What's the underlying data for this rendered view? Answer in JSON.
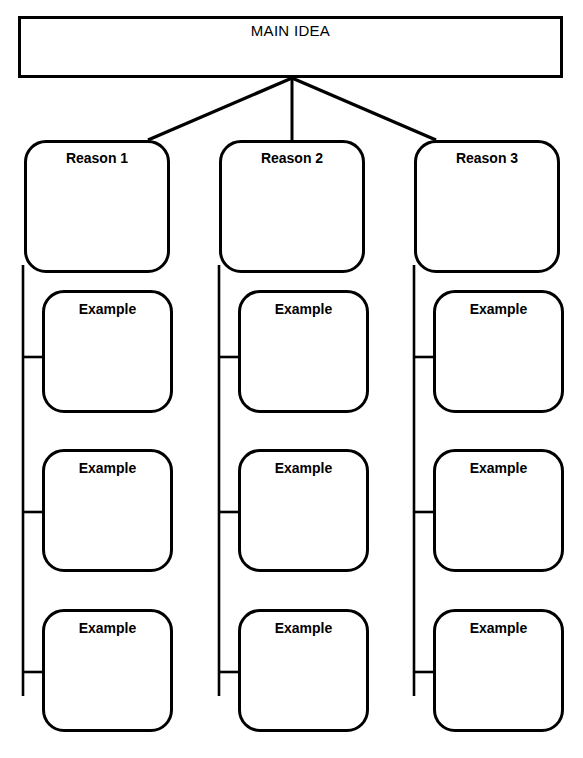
{
  "page": {
    "width": 583,
    "height": 758,
    "background_color": "#ffffff",
    "line_color": "#000000",
    "caption_cut_off": "FIGURE 5"
  },
  "diagram": {
    "type": "hierarchical-graphic-organizer",
    "title_node": {
      "label": "MAIN IDEA",
      "shape": "rectangle",
      "bold": false
    },
    "branches": [
      {
        "reason": {
          "label": "Reason 1",
          "shape": "rounded-rectangle",
          "bold": true
        },
        "examples": [
          {
            "label": "Example",
            "shape": "rounded-rectangle",
            "bold": true
          },
          {
            "label": "Example",
            "shape": "rounded-rectangle",
            "bold": true
          },
          {
            "label": "Example",
            "shape": "rounded-rectangle",
            "bold": true
          }
        ]
      },
      {
        "reason": {
          "label": "Reason 2",
          "shape": "rounded-rectangle",
          "bold": true
        },
        "examples": [
          {
            "label": "Example",
            "shape": "rounded-rectangle",
            "bold": true
          },
          {
            "label": "Example",
            "shape": "rounded-rectangle",
            "bold": true
          },
          {
            "label": "Example",
            "shape": "rounded-rectangle",
            "bold": true
          }
        ]
      },
      {
        "reason": {
          "label": "Reason 3",
          "shape": "rounded-rectangle",
          "bold": true
        },
        "examples": [
          {
            "label": "Example",
            "shape": "rounded-rectangle",
            "bold": true
          },
          {
            "label": "Example",
            "shape": "rounded-rectangle",
            "bold": true
          },
          {
            "label": "Example",
            "shape": "rounded-rectangle",
            "bold": true
          }
        ]
      }
    ]
  }
}
